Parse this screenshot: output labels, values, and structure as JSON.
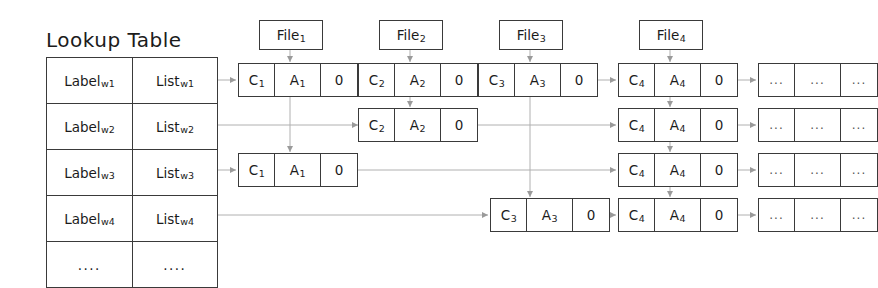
{
  "diagram": {
    "title": "Lookup Table",
    "lookup_table": {
      "rows": [
        {
          "label": "Label",
          "label_sub": "w1",
          "list": "List",
          "list_sub": "w1"
        },
        {
          "label": "Label",
          "label_sub": "w2",
          "list": "List",
          "list_sub": "w2"
        },
        {
          "label": "Label",
          "label_sub": "w3",
          "list": "List",
          "list_sub": "w3"
        },
        {
          "label": "Label",
          "label_sub": "w4",
          "list": "List",
          "list_sub": "w4"
        },
        {
          "label": "....",
          "label_sub": "",
          "list": "....",
          "list_sub": ""
        }
      ]
    },
    "files": [
      {
        "name": "File",
        "sub": "1"
      },
      {
        "name": "File",
        "sub": "2"
      },
      {
        "name": "File",
        "sub": "3"
      },
      {
        "name": "File",
        "sub": "4"
      }
    ],
    "rows": [
      {
        "nodes": [
          {
            "c": "C",
            "c_sub": "1",
            "a": "A",
            "a_sub": "1",
            "z": "0"
          },
          {
            "c": "C",
            "c_sub": "2",
            "a": "A",
            "a_sub": "2",
            "z": "0"
          },
          {
            "c": "C",
            "c_sub": "3",
            "a": "A",
            "a_sub": "3",
            "z": "0"
          },
          {
            "c": "C",
            "c_sub": "4",
            "a": "A",
            "a_sub": "4",
            "z": "0"
          },
          {
            "c": "...",
            "c_sub": "",
            "a": "...",
            "a_sub": "",
            "z": "..."
          }
        ]
      },
      {
        "nodes": [
          {
            "c": "C",
            "c_sub": "2",
            "a": "A",
            "a_sub": "2",
            "z": "0"
          },
          {
            "c": "C",
            "c_sub": "4",
            "a": "A",
            "a_sub": "4",
            "z": "0"
          },
          {
            "c": "...",
            "c_sub": "",
            "a": "...",
            "a_sub": "",
            "z": "..."
          }
        ]
      },
      {
        "nodes": [
          {
            "c": "C",
            "c_sub": "1",
            "a": "A",
            "a_sub": "1",
            "z": "0"
          },
          {
            "c": "C",
            "c_sub": "4",
            "a": "A",
            "a_sub": "4",
            "z": "0"
          },
          {
            "c": "...",
            "c_sub": "",
            "a": "...",
            "a_sub": "",
            "z": "..."
          }
        ]
      },
      {
        "nodes": [
          {
            "c": "C",
            "c_sub": "3",
            "a": "A",
            "a_sub": "3",
            "z": "0"
          },
          {
            "c": "C",
            "c_sub": "4",
            "a": "A",
            "a_sub": "4",
            "z": "0"
          },
          {
            "c": "...",
            "c_sub": "",
            "a": "...",
            "a_sub": "",
            "z": "..."
          }
        ]
      }
    ],
    "colors": {
      "stroke": "#3a3a3a",
      "arrow": "#9a9a9a",
      "text": "#1b1b1b",
      "background": "#ffffff"
    }
  }
}
